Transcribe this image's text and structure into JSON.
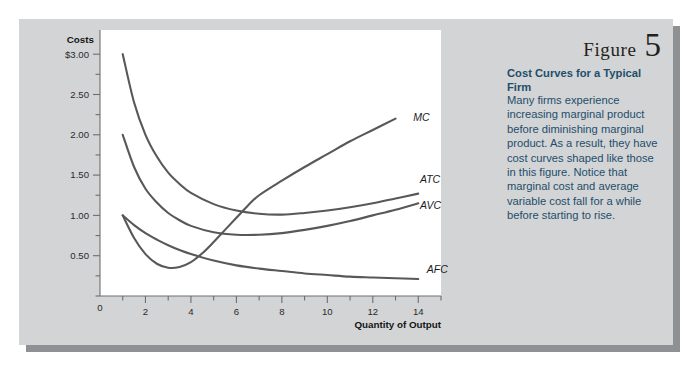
{
  "figure": {
    "label_word": "Figure",
    "number": "5",
    "caption_title": "Cost Curves for a Typical Firm",
    "caption_body": "Many firms experience increasing marginal product before diminishing marginal product. As a result, they have cost curves shaped like those in this figure. Notice that marginal cost and average variable cost fall for a while before starting to rise."
  },
  "colors": {
    "panel_background": "#d3d4d6",
    "panel_shadow": "#8e9094",
    "plot_background": "#ffffff",
    "caption_text": "#1d4e6b",
    "curve_stroke": "#58585a",
    "axis_stroke": "#6e6e70"
  },
  "chart_data": {
    "type": "line",
    "title": "Cost Curves for a Typical Firm",
    "xlabel": "Quantity of Output",
    "ylabel": "Costs",
    "xlim": [
      0,
      15
    ],
    "ylim": [
      0,
      3.3
    ],
    "grid": false,
    "legend": "inline-right-of-curve",
    "xticks": [
      0,
      1,
      2,
      3,
      4,
      5,
      6,
      7,
      8,
      9,
      10,
      11,
      12,
      13,
      14,
      15
    ],
    "xtick_labels": [
      "0",
      "",
      "2",
      "",
      "4",
      "",
      "6",
      "",
      "8",
      "",
      "10",
      "",
      "12",
      "",
      "14",
      ""
    ],
    "yticks": [
      0,
      0.25,
      0.5,
      0.75,
      1.0,
      1.25,
      1.5,
      1.75,
      2.0,
      2.25,
      2.5,
      2.75,
      3.0
    ],
    "ytick_labels": [
      "",
      "",
      "0.50",
      "",
      "1.00",
      "",
      "1.50",
      "",
      "2.00",
      "",
      "2.50",
      "",
      "$3.00"
    ],
    "y_axis_origin_label": "0",
    "series": [
      {
        "name": "MC",
        "label": "MC",
        "label_x": 13.6,
        "label_y": 2.22,
        "x": [
          1.0,
          1.5,
          2.0,
          2.5,
          3.0,
          3.5,
          4.0,
          4.5,
          5.0,
          5.5,
          6.0,
          6.5,
          7.0,
          8.0,
          9.0,
          10.0,
          11.0,
          12.0,
          13.0
        ],
        "y": [
          1.0,
          0.72,
          0.52,
          0.4,
          0.35,
          0.36,
          0.42,
          0.53,
          0.67,
          0.82,
          0.97,
          1.12,
          1.25,
          1.43,
          1.6,
          1.76,
          1.92,
          2.06,
          2.2
        ]
      },
      {
        "name": "ATC",
        "label": "ATC",
        "label_x": 13.9,
        "label_y": 1.44,
        "x": [
          1.0,
          1.5,
          2.0,
          2.5,
          3.0,
          3.5,
          4.0,
          5.0,
          6.0,
          7.0,
          8.0,
          9.0,
          10.0,
          11.0,
          12.0,
          13.0,
          14.0
        ],
        "y": [
          3.0,
          2.4,
          2.0,
          1.73,
          1.53,
          1.39,
          1.28,
          1.14,
          1.06,
          1.02,
          1.01,
          1.03,
          1.06,
          1.1,
          1.15,
          1.21,
          1.27
        ]
      },
      {
        "name": "AVC",
        "label": "AVC",
        "label_x": 13.9,
        "label_y": 1.12,
        "x": [
          1.0,
          1.5,
          2.0,
          2.5,
          3.0,
          3.5,
          4.0,
          5.0,
          6.0,
          7.0,
          8.0,
          9.0,
          10.0,
          11.0,
          12.0,
          13.0,
          14.0
        ],
        "y": [
          2.0,
          1.6,
          1.33,
          1.16,
          1.03,
          0.94,
          0.87,
          0.79,
          0.76,
          0.76,
          0.78,
          0.82,
          0.87,
          0.93,
          1.0,
          1.07,
          1.15
        ]
      },
      {
        "name": "AFC",
        "label": "AFC",
        "label_x": 14.2,
        "label_y": 0.33,
        "x": [
          1.0,
          1.5,
          2.0,
          2.5,
          3.0,
          3.5,
          4.0,
          5.0,
          6.0,
          7.0,
          8.0,
          9.0,
          10.0,
          11.0,
          12.0,
          13.0,
          14.0
        ],
        "y": [
          1.0,
          0.88,
          0.78,
          0.7,
          0.63,
          0.57,
          0.52,
          0.44,
          0.38,
          0.34,
          0.31,
          0.28,
          0.26,
          0.24,
          0.23,
          0.22,
          0.21
        ]
      }
    ]
  }
}
